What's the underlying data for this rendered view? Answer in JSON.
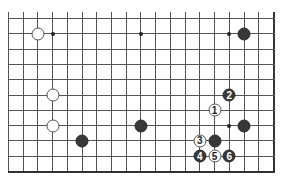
{
  "diagram": {
    "type": "go-board-fragment",
    "grid": {
      "columns": 19,
      "rows": 11,
      "x0": 8,
      "x_step": 14.72,
      "y0": 18,
      "y_step": 15.3,
      "top_edge_open": true,
      "left_edge_open": true,
      "right_edge_board": true,
      "bottom_edge_board": true,
      "line_extension_top": 6
    },
    "colors": {
      "line": "#555555",
      "black_stone": "#383838",
      "white_stone": "#ffffff"
    },
    "star_points": [
      {
        "col": 3,
        "row": 1
      },
      {
        "col": 9,
        "row": 1
      },
      {
        "col": 15,
        "row": 1
      },
      {
        "col": 15,
        "row": 7
      }
    ],
    "stones": [
      {
        "color": "white",
        "col": 2,
        "row": 1,
        "label": ""
      },
      {
        "color": "black",
        "col": 16,
        "row": 1,
        "label": ""
      },
      {
        "color": "white",
        "col": 3,
        "row": 5,
        "label": ""
      },
      {
        "color": "white",
        "col": 3,
        "row": 7,
        "label": ""
      },
      {
        "color": "black",
        "col": 5,
        "row": 8,
        "label": ""
      },
      {
        "color": "black",
        "col": 9,
        "row": 7,
        "label": ""
      },
      {
        "color": "black",
        "col": 16,
        "row": 7,
        "label": ""
      },
      {
        "color": "black",
        "col": 14,
        "row": 8,
        "label": ""
      },
      {
        "color": "white",
        "col": 14,
        "row": 6,
        "label": "1"
      },
      {
        "color": "black",
        "col": 15,
        "row": 5,
        "label": "2"
      },
      {
        "color": "white",
        "col": 13,
        "row": 8,
        "label": "3"
      },
      {
        "color": "black",
        "col": 13,
        "row": 9,
        "label": "4"
      },
      {
        "color": "white",
        "col": 14,
        "row": 9,
        "label": "5"
      },
      {
        "color": "black",
        "col": 15,
        "row": 9,
        "label": "6"
      }
    ]
  }
}
